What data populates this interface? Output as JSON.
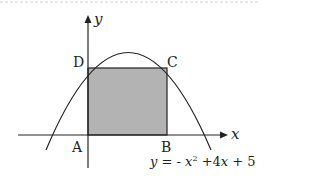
{
  "figure": {
    "points": {
      "A": "A",
      "B": "B",
      "C": "C",
      "D": "D"
    },
    "axes": {
      "x_label": "x",
      "y_label": "y"
    },
    "equation": {
      "lhs": "y = -",
      "x_term": "x",
      "exponent": "2",
      "rest": " +4",
      "x_term2": "x",
      "constant": " + 5"
    },
    "colors": {
      "rect_fill": "#b3b3b3",
      "stroke": "#222222"
    }
  }
}
